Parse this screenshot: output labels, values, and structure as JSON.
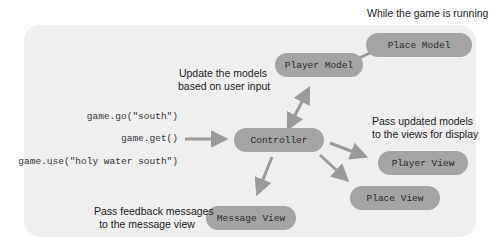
{
  "header": {
    "context_label": "While the game is running"
  },
  "inputs": {
    "commands": [
      "game.go(\"south\")",
      "game.get()",
      "game.use(\"holy water south\")"
    ]
  },
  "nodes": {
    "place_model": "Place Model",
    "player_model": "Player Model",
    "controller": "Controller",
    "player_view": "Player View",
    "place_view": "Place View",
    "message_view": "Message View"
  },
  "annotations": {
    "update_models": [
      "Update the models",
      "based on user input"
    ],
    "pass_models": [
      "Pass updated models",
      "to the views for display"
    ],
    "pass_feedback": [
      "Pass feedback messages",
      "to the message view"
    ]
  },
  "colors": {
    "panel": "#efefef",
    "node": "#a4a4a4",
    "arrow": "#9a9a9a",
    "text": "#1a1a1a"
  }
}
